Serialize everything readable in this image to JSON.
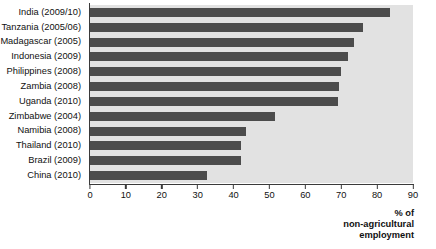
{
  "chart_data": {
    "type": "bar",
    "orientation": "horizontal",
    "title": "",
    "subtitle": "",
    "xlabel": "% of non-agricultural employment",
    "ylabel": "",
    "xlim": [
      0,
      90
    ],
    "xticks": [
      0,
      10,
      20,
      30,
      40,
      50,
      60,
      70,
      80,
      90
    ],
    "grid": false,
    "legend": null,
    "categories": [
      "India (2009/10)",
      "Tanzania (2005/06)",
      "Madagascar (2005)",
      "Indonesia (2009)",
      "Philippines (2008)",
      "Zambia (2008)",
      "Uganda (2010)",
      "Zimbabwe (2004)",
      "Namibia (2008)",
      "Thailand (2010)",
      "Brazil (2009)",
      "China (2010)"
    ],
    "values": [
      83.5,
      76,
      73.5,
      72,
      70,
      69.5,
      69,
      51.5,
      43.5,
      42,
      42,
      32.5
    ],
    "colors": {
      "bar": "#4c4c4c",
      "plot_background": "#e2e2e2",
      "page_background": "#ffffff",
      "axis": "#3a3a3a",
      "text": "#111111"
    }
  },
  "axis_title_lines": [
    "% of",
    "non-agricultural",
    "employment"
  ]
}
